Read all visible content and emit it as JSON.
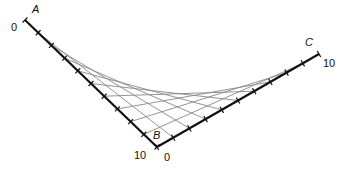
{
  "diagram": {
    "points": {
      "A": {
        "label": "A",
        "x": 25,
        "y": 20
      },
      "B": {
        "label": "B",
        "x": 157,
        "y": 147
      },
      "C": {
        "label": "C",
        "x": 319,
        "y": 54
      }
    },
    "axis_BA": {
      "start_label": "0",
      "end_label": "10",
      "divisions": 10
    },
    "axis_BC": {
      "start_label": "0",
      "end_label": "10",
      "divisions": 10
    },
    "line_color": "#888888",
    "axis_color": "#111111"
  }
}
